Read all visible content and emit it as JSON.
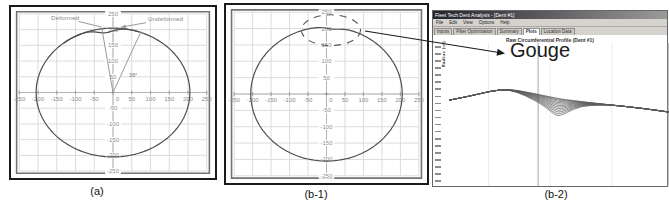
{
  "figure": {
    "captions": [
      "(a)",
      "(b-1)",
      "(b-2)"
    ]
  },
  "app_window": {
    "window_title": "Fleet Tech Dent Analysis - [Dent #1]",
    "menu_items": [
      "File",
      "Edit",
      "View",
      "Options",
      "Help"
    ],
    "tabs": [
      "Inputs",
      "Filter Optimization",
      "Summary",
      "Plots",
      "Location Data"
    ],
    "active_tab": "Plots",
    "chart_title": "Raw Circumferential Profile (Dent #1)",
    "y_axis_label": "Radius (in)",
    "gouge_label": "Gouge"
  },
  "chart_data": [
    {
      "panel": "a",
      "type": "line",
      "xlim": [
        -250,
        250
      ],
      "ylim": [
        -250,
        250
      ],
      "tick_step": 50,
      "ticks": [
        -250,
        -200,
        -150,
        -100,
        -50,
        0,
        50,
        100,
        150,
        200,
        250
      ],
      "grid": true,
      "series": [
        {
          "name": "Undeformed",
          "shape": "circle",
          "radius": 205
        },
        {
          "name": "Deformed",
          "shape": "dented-arc",
          "radius": 205,
          "dent_angle_deg": 96,
          "dent_depth": 14,
          "dent_width_deg": 9,
          "arc_span_deg": [
            70,
            130
          ]
        }
      ],
      "angle": {
        "label": "38°",
        "label_pos": [
          42,
          48
        ],
        "lines": [
          [
            [
              0,
              0
            ],
            [
              -30,
              205
            ]
          ],
          [
            [
              0,
              0
            ],
            [
              75,
              195
            ]
          ]
        ]
      },
      "labels": [
        {
          "text": "Deformed",
          "pos": [
            -128,
            232
          ],
          "leader": [
            [
              -92,
              226
            ],
            [
              -30,
              208
            ]
          ],
          "arrow": false
        },
        {
          "text": "Undeformed",
          "pos": [
            140,
            228
          ],
          "leader": [
            [
              88,
              222
            ],
            [
              22,
              208
            ]
          ],
          "arrow": true
        }
      ]
    },
    {
      "panel": "b-1",
      "type": "line",
      "xlim": [
        -250,
        250
      ],
      "ylim": [
        -250,
        250
      ],
      "tick_step": 50,
      "ticks": [
        -250,
        -200,
        -150,
        -100,
        -50,
        0,
        50,
        100,
        150,
        200,
        250
      ],
      "grid": true,
      "series": [
        {
          "name": "Measured profile",
          "shape": "circle",
          "radius": 205,
          "dent_angle_deg": 85,
          "dent_depth": 6,
          "dent_width_deg": 8
        }
      ],
      "highlight": {
        "cx": 12,
        "cy": 195,
        "rx": 80,
        "ry": 47,
        "style": "dashed"
      }
    },
    {
      "panel": "b-2",
      "type": "line",
      "title": "Raw Circumferential Profile (Dent #1)",
      "series_count": 13,
      "envelope_top": [
        [
          0,
          40
        ],
        [
          10,
          37
        ],
        [
          19,
          33.6
        ],
        [
          27,
          32.2
        ],
        [
          33,
          33.6
        ],
        [
          42,
          36.4
        ],
        [
          51,
          39.2
        ],
        [
          62,
          41.3
        ],
        [
          74,
          43.4
        ],
        [
          87,
          45.5
        ],
        [
          100,
          48.3
        ]
      ],
      "envelope_bottom": [
        [
          0,
          40
        ],
        [
          10,
          37
        ],
        [
          19,
          33.6
        ],
        [
          27,
          32.2
        ],
        [
          35,
          37
        ],
        [
          42,
          42.7
        ],
        [
          46,
          47.6
        ],
        [
          49.5,
          51.7
        ],
        [
          53,
          49
        ],
        [
          60,
          44
        ],
        [
          69,
          43.4
        ],
        [
          74,
          43.4
        ],
        [
          87,
          45.5
        ],
        [
          100,
          48.3
        ]
      ],
      "crosshair_x": 40.5,
      "gridline_xs": [
        18,
        46,
        74
      ],
      "right_border_x": 99.6,
      "y_tick_count": 20
    }
  ]
}
